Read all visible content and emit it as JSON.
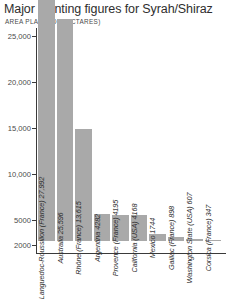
{
  "chart_data": {
    "type": "bar",
    "title": "Major planting figures for Syrah/Shiraz",
    "subtitle": "AREA PLANTED (HECTARES)",
    "xlabel": "",
    "ylabel": "AREA PLANTED (HECTARES)",
    "grid": false,
    "legend": "none",
    "orientation": "vertical",
    "bar_color": "#a9a9a9",
    "axis_color": "#3a3a3a",
    "ylim": [
      0,
      27992
    ],
    "yticks": [
      {
        "value": 25000,
        "label": "25,000"
      },
      {
        "value": 20000,
        "label": "20,000"
      },
      {
        "value": 15000,
        "label": "15,000"
      },
      {
        "value": 10000,
        "label": "10,000"
      },
      {
        "value": 5000,
        "label": "5000"
      },
      {
        "value": 2000,
        "label": "2000"
      }
    ],
    "categories": [
      "Languedoc-Roussillon (France)",
      "Australia",
      "Rhône (France)",
      "Argentina",
      "Provence (France)",
      "California (USA)",
      "Mexico",
      "Gaillac (France)",
      "Washington State (USA)",
      "Corsica (France)"
    ],
    "values": [
      27992,
      25596,
      13615,
      4282,
      4195,
      4168,
      1744,
      898,
      607,
      347
    ],
    "bars": [
      {
        "label": "Languedoc-Roussillon (France) 27,992",
        "category": "Languedoc-Roussillon (France)",
        "value": 27992,
        "value_text": "27,992"
      },
      {
        "label": "Australia 25,596",
        "category": "Australia",
        "value": 25596,
        "value_text": "25,596"
      },
      {
        "label": "Rhône (France) 13,615",
        "category": "Rhône (France)",
        "value": 13615,
        "value_text": "13,615"
      },
      {
        "label": "Argentina 4282",
        "category": "Argentina",
        "value": 4282,
        "value_text": "4282"
      },
      {
        "label": "Provence (France) 4195",
        "category": "Provence (France)",
        "value": 4195,
        "value_text": "4195"
      },
      {
        "label": "California (USA) 4168",
        "category": "California (USA)",
        "value": 4168,
        "value_text": "4168"
      },
      {
        "label": "Mexico 1744",
        "category": "Mexico",
        "value": 1744,
        "value_text": "1744"
      },
      {
        "label": "Gaillac (France) 898",
        "category": "Gaillac (France)",
        "value": 898,
        "value_text": "898"
      },
      {
        "label": "Washington State (USA) 607",
        "category": "Washington State (USA)",
        "value": 607,
        "value_text": "607"
      },
      {
        "label": "Corsica (France) 347",
        "category": "Corsica (France)",
        "value": 347,
        "value_text": "347"
      }
    ]
  }
}
